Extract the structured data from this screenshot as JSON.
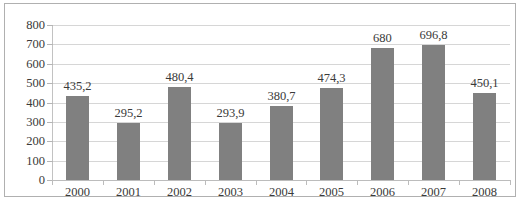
{
  "chart_data": {
    "type": "bar",
    "title": "",
    "xlabel": "",
    "ylabel": "",
    "categories": [
      "2000",
      "2001",
      "2002",
      "2003",
      "2004",
      "2005",
      "2006",
      "2007",
      "2008"
    ],
    "values": [
      435.2,
      295.2,
      480.4,
      293.9,
      380.7,
      474.3,
      680,
      696.8,
      450.1
    ],
    "value_labels": [
      "435,2",
      "295,2",
      "480,4",
      "293,9",
      "380,7",
      "474,3",
      "680",
      "696,8",
      "450,1"
    ],
    "ylim": [
      0,
      800
    ],
    "ytick_values": [
      0,
      100,
      200,
      300,
      400,
      500,
      600,
      700,
      800
    ],
    "ytick_labels": [
      "800",
      "700",
      "600",
      "500",
      "400",
      "300",
      "200",
      "100",
      "0"
    ],
    "grid": true,
    "legend": "none",
    "series_color": "#808080",
    "gridline_color": "#d6d6d6",
    "decimal_separator": ","
  },
  "caption": {
    "remnant_text": ""
  }
}
